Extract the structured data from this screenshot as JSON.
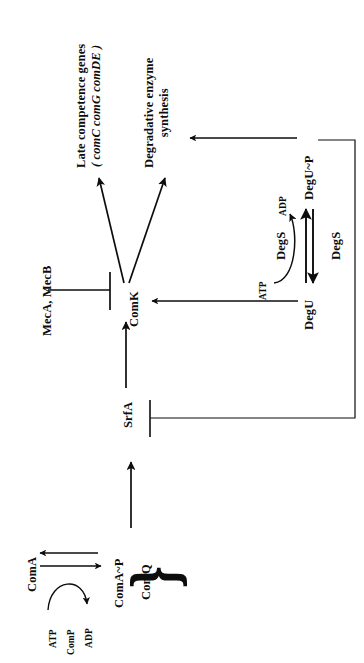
{
  "figure": {
    "type": "signaling-pathway-diagram",
    "orientation": "rotated-90-ccw",
    "background_color": "#ffffff",
    "ink_color": "#0d0d0d"
  },
  "nodes": {
    "late_competence_genes": {
      "label_line1": "Late competence genes",
      "label_line2": "( comC comG comDE )",
      "genes_italic": "comC comG comDE"
    },
    "degradative_enzyme": {
      "label_line1": "Degradative enzyme",
      "label_line2": "synthesis"
    },
    "mec": {
      "label": "MecA, MecB"
    },
    "comk": {
      "label": "ComK"
    },
    "srfa": {
      "label": "SrfA"
    },
    "coma": {
      "label": "ComA"
    },
    "coma_p": {
      "label": "ComA~P"
    },
    "comq": {
      "label": "ComQ"
    },
    "comp": {
      "label": "ComP"
    },
    "degu": {
      "label": "DegU"
    },
    "degu_p": {
      "label": "DegU~P"
    },
    "degs_upper": {
      "label": "DegS"
    },
    "degs_lower": {
      "label": "DegS"
    }
  },
  "cofactors": {
    "atp_coma": {
      "label": "ATP"
    },
    "adp_coma": {
      "label": "ADP"
    },
    "atp_degu": {
      "label": "ATP"
    },
    "adp_degu": {
      "label": "ADP"
    }
  },
  "edges": [
    {
      "name": "comk-to-late-competence-genes",
      "kind": "activation-arrow",
      "from": "ComK",
      "to": "Late competence genes"
    },
    {
      "name": "comk-to-degradative-enzyme",
      "kind": "activation-arrow",
      "from": "ComK",
      "to": "Degradative enzyme synthesis"
    },
    {
      "name": "mec-inhibits-comk",
      "kind": "inhibition-bar",
      "from": "MecA, MecB",
      "to": "ComK"
    },
    {
      "name": "srfa-to-comk",
      "kind": "activation-arrow",
      "from": "SrfA",
      "to": "ComK"
    },
    {
      "name": "degu-to-comk",
      "kind": "activation-arrow",
      "from": "DegU",
      "to": "ComK"
    },
    {
      "name": "degu-p-to-degradative-enzyme",
      "kind": "activation-arrow",
      "from": "DegU~P",
      "to": "Degradative enzyme synthesis"
    },
    {
      "name": "degu-p-inhibits-srfa",
      "kind": "inhibition-bar",
      "from": "DegU~P",
      "to": "SrfA"
    },
    {
      "name": "degu-to-degu-p",
      "kind": "phosphorylation-arrow",
      "from": "DegU",
      "to": "DegU~P",
      "enzyme": "DegS"
    },
    {
      "name": "degu-p-to-degu",
      "kind": "dephosphorylation-arrow",
      "from": "DegU~P",
      "to": "DegU",
      "enzyme": "DegS"
    },
    {
      "name": "degu-atp-to-adp",
      "kind": "curved-cofactor-arrow",
      "from": "ATP",
      "to": "ADP",
      "enzyme": "DegS"
    },
    {
      "name": "coma-to-coma-p",
      "kind": "phosphorylation-arrow",
      "from": "ComA",
      "to": "ComA~P",
      "enzyme": "ComP"
    },
    {
      "name": "coma-p-to-coma",
      "kind": "dephosphorylation-arrow",
      "from": "ComA~P",
      "to": "ComA"
    },
    {
      "name": "coma-atp-to-adp",
      "kind": "curved-cofactor-arrow",
      "from": "ATP",
      "to": "ADP",
      "enzyme": "ComP"
    },
    {
      "name": "comaq-complex-to-srfa",
      "kind": "activation-arrow",
      "from": "ComA~P / ComQ",
      "to": "SrfA"
    }
  ],
  "brace": {
    "name": "coma-p-comq-brace",
    "glyph": "}",
    "groups": [
      "ComA~P",
      "ComQ"
    ]
  }
}
